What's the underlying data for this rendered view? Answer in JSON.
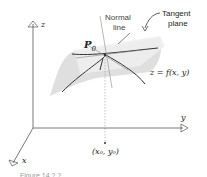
{
  "figure": {
    "labels": {
      "z_axis": "z",
      "y_axis": "y",
      "x_axis": "x",
      "normal_line_1": "Normal",
      "normal_line_2": "line",
      "tangent_plane_1": "Tangent",
      "tangent_plane_2": "plane",
      "point": "P",
      "point_sub": "0",
      "surface_eq": "z = f(x, y)",
      "base_point": "(x₀, y₀)",
      "caption": "Figure 14.?.?"
    },
    "colors": {
      "axis": "#555555",
      "surface": "#d9d9d9",
      "plane": "#ebebeb",
      "curve": "#333333",
      "normal": "#999999"
    }
  }
}
